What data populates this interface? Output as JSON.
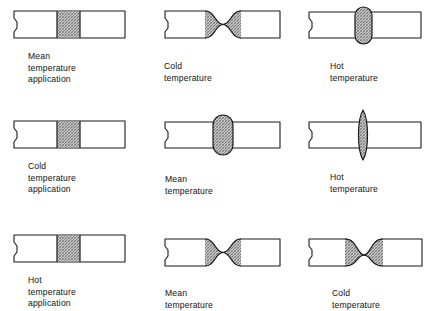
{
  "figure": {
    "title": "",
    "grid": {
      "rows": 3,
      "columns": 3
    },
    "colors": {
      "outline": "#1a1a1a",
      "bar_fill": "#ffffff",
      "hatch_fill": "#bdbdbd",
      "hatch_line": "#6e6e6e",
      "background": "#ffffff",
      "text": "#121212"
    }
  },
  "cells": [
    {
      "id": "r1c1",
      "row": 1,
      "column": 1,
      "shape": "straight-bar-hatched-center",
      "caption": "Mean temperature\napplication",
      "caption_line1": "Mean temperature",
      "caption_line2": "application"
    },
    {
      "id": "r1c2",
      "row": 1,
      "column": 2,
      "shape": "necked-bar-shallow",
      "caption": "Cold temperature",
      "caption_line1": "Cold temperature",
      "caption_line2": ""
    },
    {
      "id": "r1c3",
      "row": 1,
      "column": 3,
      "shape": "bulged-bar-capsule",
      "caption": "Hot temperature",
      "caption_line1": "Hot temperature",
      "caption_line2": ""
    },
    {
      "id": "r2c1",
      "row": 2,
      "column": 1,
      "shape": "straight-bar-hatched-center",
      "caption": "Cold temperature\napplication",
      "caption_line1": "Cold temperature",
      "caption_line2": "application"
    },
    {
      "id": "r2c2",
      "row": 2,
      "column": 2,
      "shape": "bulged-bar-capsule",
      "caption": "Mean temperature",
      "caption_line1": "Mean temperature",
      "caption_line2": ""
    },
    {
      "id": "r2c3",
      "row": 2,
      "column": 3,
      "shape": "bulged-bar-ellipse-tall",
      "caption": "Hot temperature",
      "caption_line1": "Hot temperature",
      "caption_line2": ""
    },
    {
      "id": "r3c1",
      "row": 3,
      "column": 1,
      "shape": "straight-bar-hatched-center",
      "caption": "Hot temperature\napplication",
      "caption_line1": "Hot temperature",
      "caption_line2": "application"
    },
    {
      "id": "r3c2",
      "row": 3,
      "column": 2,
      "shape": "necked-bar-shallow",
      "caption": "Mean temperature",
      "caption_line1": "Mean temperature",
      "caption_line2": ""
    },
    {
      "id": "r3c3",
      "row": 3,
      "column": 3,
      "shape": "necked-bar-deep",
      "caption": "Cold temperature",
      "caption_line1": "Cold temperature",
      "caption_line2": ""
    }
  ]
}
